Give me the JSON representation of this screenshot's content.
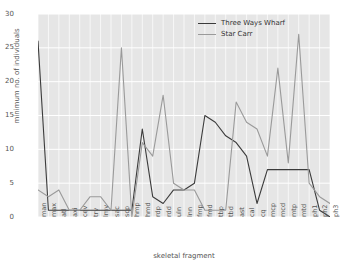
{
  "chart_data": {
    "type": "line",
    "title": "",
    "xlabel": "skeletal fragment",
    "ylabel": "minimum no. of individuals",
    "ylim": [
      0,
      30
    ],
    "yticks": [
      0,
      5,
      10,
      15,
      20,
      25,
      30
    ],
    "grid": true,
    "legend_position": "top-right",
    "categories": [
      "man",
      "max",
      "atl",
      "axi",
      "cev",
      "trv",
      "lmv",
      "sac",
      "scp",
      "hmp",
      "hmd",
      "rdp",
      "rdd",
      "uln",
      "lnn",
      "fmp",
      "fmd",
      "tbp",
      "tbd",
      "ast",
      "cal",
      "cq",
      "mcp",
      "mcd",
      "mtp",
      "mtd",
      "ph1",
      "ph2",
      "ph3"
    ],
    "series": [
      {
        "name": "Three Ways Wharf",
        "color": "#3B3B3B",
        "values": [
          26,
          1,
          1,
          1,
          1,
          1,
          1,
          1,
          1,
          1,
          13,
          3,
          2,
          4,
          4,
          5,
          15,
          14,
          12,
          11,
          9,
          2,
          7,
          7,
          7,
          7,
          7,
          1,
          0
        ]
      },
      {
        "name": "Star Carr",
        "color": "#9A9A9A",
        "values": [
          4,
          3,
          4,
          1,
          1,
          3,
          3,
          1,
          25,
          0,
          11,
          9,
          18,
          5,
          4,
          4,
          1,
          1,
          1,
          17,
          14,
          13,
          9,
          22,
          8,
          27,
          5,
          3,
          2
        ]
      }
    ]
  },
  "legend": {
    "items": [
      {
        "label": "Three Ways Wharf"
      },
      {
        "label": "Star Carr"
      }
    ]
  }
}
